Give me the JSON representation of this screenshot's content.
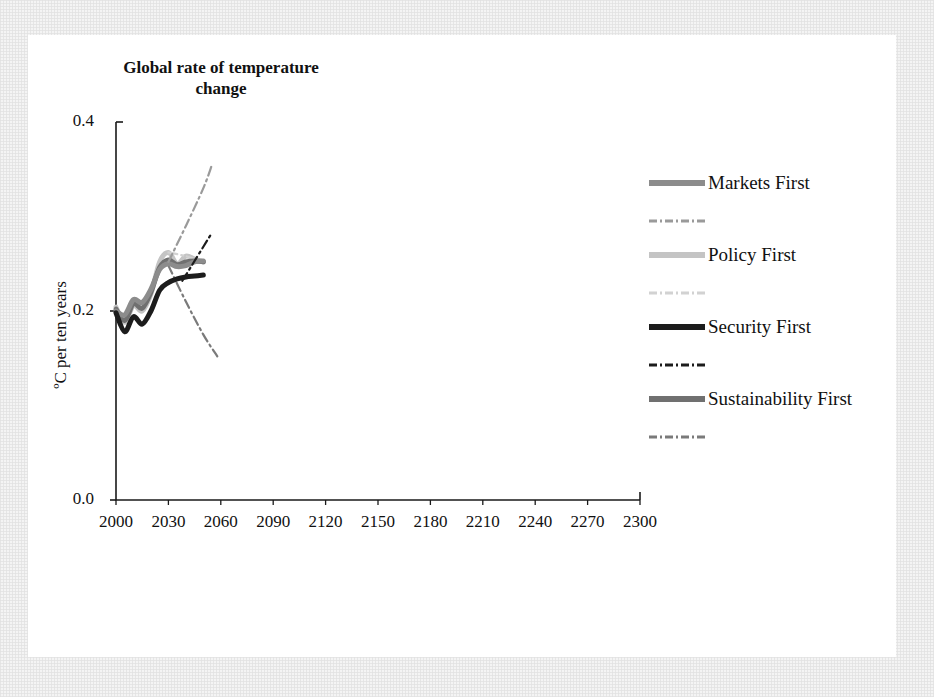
{
  "figure": {
    "title": "Global rate of temperature change",
    "y_axis_label": "ºC per ten years",
    "y_ticks": [
      "0.0",
      "0.2",
      "0.4"
    ],
    "x_ticks": [
      "2000",
      "2030",
      "2060",
      "2090",
      "2120",
      "2150",
      "2180",
      "2210",
      "2240",
      "2270",
      "2300"
    ]
  },
  "legend": {
    "entries": [
      {
        "label": "Markets First",
        "color": "#8c8c8c",
        "style": "solid"
      },
      {
        "label": "",
        "color": "#9a9a9a",
        "style": "dashdot"
      },
      {
        "label": "Policy First",
        "color": "#c4c4c4",
        "style": "solid"
      },
      {
        "label": "",
        "color": "#d2d2d2",
        "style": "dashdot"
      },
      {
        "label": "Security First",
        "color": "#1c1c1c",
        "style": "solid"
      },
      {
        "label": "",
        "color": "#1c1c1c",
        "style": "dashdot"
      },
      {
        "label": "Sustainability First",
        "color": "#707070",
        "style": "solid"
      },
      {
        "label": "",
        "color": "#7a7a7a",
        "style": "dashdot"
      }
    ]
  },
  "chart_data": {
    "type": "line",
    "title": "Global rate of temperature change",
    "xlabel": "",
    "ylabel": "ºC per ten years",
    "xlim": [
      2000,
      2300
    ],
    "ylim": [
      0.0,
      0.4
    ],
    "xticks": [
      2000,
      2030,
      2060,
      2090,
      2120,
      2150,
      2180,
      2210,
      2240,
      2270,
      2300
    ],
    "yticks": [
      0.0,
      0.2,
      0.4
    ],
    "grid": false,
    "legend_position": "right",
    "series": [
      {
        "name": "Markets First",
        "color": "#8c8c8c",
        "style": "solid",
        "x": [
          2000,
          2005,
          2010,
          2015,
          2020,
          2025,
          2030,
          2035,
          2040,
          2045,
          2050
        ],
        "y": [
          0.2,
          0.196,
          0.212,
          0.209,
          0.223,
          0.244,
          0.25,
          0.247,
          0.248,
          0.252,
          0.253
        ]
      },
      {
        "name": "Markets First (range)",
        "color": "#9a9a9a",
        "style": "dashdot",
        "x": [
          2030,
          2040,
          2050,
          2055
        ],
        "y": [
          0.252,
          0.29,
          0.33,
          0.355
        ]
      },
      {
        "name": "Policy First",
        "color": "#c4c4c4",
        "style": "solid",
        "x": [
          2000,
          2005,
          2010,
          2015,
          2020,
          2025,
          2030,
          2035,
          2040,
          2045,
          2050
        ],
        "y": [
          0.204,
          0.188,
          0.206,
          0.2,
          0.218,
          0.252,
          0.262,
          0.25,
          0.258,
          0.255,
          0.252
        ]
      },
      {
        "name": "Policy First (range)",
        "color": "#d2d2d2",
        "style": "dashdot",
        "x": [
          2030,
          2040,
          2050
        ],
        "y": [
          0.262,
          0.258,
          0.252
        ]
      },
      {
        "name": "Security First",
        "color": "#1c1c1c",
        "style": "solid",
        "x": [
          2000,
          2005,
          2010,
          2015,
          2020,
          2025,
          2030,
          2035,
          2040,
          2045,
          2050
        ],
        "y": [
          0.198,
          0.178,
          0.194,
          0.186,
          0.2,
          0.222,
          0.23,
          0.234,
          0.236,
          0.237,
          0.238
        ]
      },
      {
        "name": "Security First (range)",
        "color": "#1c1c1c",
        "style": "dashdot",
        "x": [
          2038,
          2044,
          2050,
          2054
        ],
        "y": [
          0.232,
          0.25,
          0.268,
          0.28
        ]
      },
      {
        "name": "Sustainability First",
        "color": "#707070",
        "style": "solid",
        "x": [
          2000,
          2005,
          2010,
          2015,
          2020,
          2025,
          2030,
          2035,
          2040,
          2045,
          2050
        ],
        "y": [
          0.202,
          0.19,
          0.208,
          0.203,
          0.22,
          0.246,
          0.254,
          0.249,
          0.252,
          0.253,
          0.252
        ]
      },
      {
        "name": "Sustainability First (range)",
        "color": "#7a7a7a",
        "style": "dashdot",
        "x": [
          2030,
          2040,
          2050,
          2058
        ],
        "y": [
          0.248,
          0.21,
          0.175,
          0.152
        ]
      }
    ]
  }
}
